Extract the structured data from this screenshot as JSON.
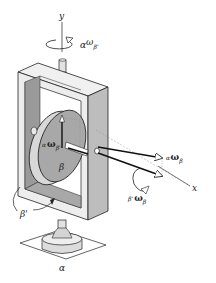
{
  "figure": {
    "colors": {
      "line": "#222222",
      "frame_face": "#ededed",
      "frame_inner": "#9a9a9a",
      "disk_face": "#a8a8a8",
      "disk_rim": "#d8d8d8",
      "shaft": "#e2e2e2",
      "base": "#dcdcdc"
    }
  },
  "labels": {
    "y_axis": "y",
    "x_axis": "x",
    "top_omega": {
      "pre": "α",
      "omega": "ω",
      "sub": "β'"
    },
    "disk_omega": {
      "pre": "α",
      "omega": "ω",
      "sub": "β'"
    },
    "right_omega": {
      "pre": "α",
      "omega": "ω",
      "sub": "β"
    },
    "lower_omega": {
      "pre": "β'",
      "omega": "ω",
      "sub": "β"
    },
    "disk_body": "β",
    "frame_body": "β'",
    "base_body": "α"
  }
}
